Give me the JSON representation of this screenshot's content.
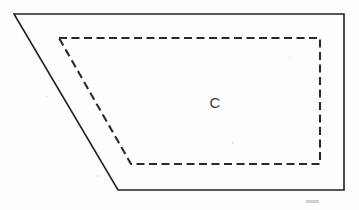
{
  "figure": {
    "background_color": "#fefefe",
    "label": "C",
    "label_position": {
      "x": 215,
      "y": 108
    },
    "outer_shape": {
      "name": "solid-quadrilateral",
      "style": "solid",
      "stroke_color": "#212121",
      "stroke_width": 1.6,
      "points": "14,14 344,14 344,190 118,190",
      "vertices": [
        {
          "x": 14,
          "y": 14
        },
        {
          "x": 344,
          "y": 14
        },
        {
          "x": 344,
          "y": 190
        },
        {
          "x": 118,
          "y": 190
        }
      ]
    },
    "inner_shape": {
      "name": "dashed-quadrilateral",
      "style": "dashed",
      "stroke_color": "#2a2a2a",
      "stroke_width": 2.1,
      "dash_pattern": "8 4.5",
      "points": "59,38 320,38 320,164 131,164",
      "vertices": [
        {
          "x": 59,
          "y": 38
        },
        {
          "x": 320,
          "y": 38
        },
        {
          "x": 320,
          "y": 164
        },
        {
          "x": 131,
          "y": 164
        }
      ]
    },
    "artifact": {
      "name": "scan-smudge",
      "color": "#9a9a9a"
    }
  }
}
